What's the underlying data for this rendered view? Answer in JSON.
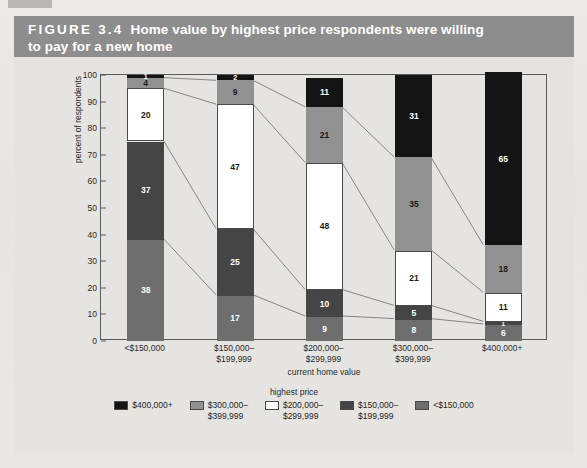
{
  "figure": {
    "number": "FIGURE 3.4",
    "title_line1": "Home value by highest price respondents were willing",
    "title_line2": "to pay for a new home",
    "header_bg": "#8d8d8d"
  },
  "chart_data": {
    "type": "bar",
    "variant": "stacked-100-percent",
    "title": "Home value by highest price respondents were willing to pay for a new home",
    "xlabel": "current home value",
    "ylabel": "percent of respondents",
    "ylim": [
      0,
      100
    ],
    "ytick_labels": [
      "0",
      "10",
      "20",
      "30",
      "40",
      "50",
      "60",
      "70",
      "80",
      "90",
      "100"
    ],
    "ytick_values": [
      0,
      10,
      20,
      30,
      40,
      50,
      60,
      70,
      80,
      90,
      100
    ],
    "grid": false,
    "legend_position": "bottom",
    "legend_title": "highest price",
    "categories": [
      "<$150,000",
      "$150,000–\n$199,999",
      "$200,000–\n$299,999",
      "$300,000–\n$399,999",
      "$400,000+"
    ],
    "category_labels": [
      [
        "<$150,000",
        ""
      ],
      [
        "$150,000–",
        "$199,999"
      ],
      [
        "$200,000–",
        "$299,999"
      ],
      [
        "$300,000–",
        "$399,999"
      ],
      [
        "$400,000+",
        ""
      ]
    ],
    "series": [
      {
        "name": "<$150,000",
        "color": "#6e6e6e",
        "text_color": "#ffffff",
        "values": [
          38,
          17,
          9,
          8,
          6
        ]
      },
      {
        "name": "$150,000–$199,999",
        "color": "#454545",
        "text_color": "#ffffff",
        "values": [
          37,
          25,
          10,
          5,
          1
        ]
      },
      {
        "name": "$200,000–$299,999",
        "color": "#ffffff",
        "text_color": "#1a1a1a",
        "values": [
          20,
          47,
          48,
          21,
          11
        ]
      },
      {
        "name": "$300,000–$399,999",
        "color": "#919191",
        "text_color": "#1a1a1a",
        "values": [
          4,
          9,
          21,
          35,
          18
        ]
      },
      {
        "name": "$400,000+",
        "color": "#141414",
        "text_color": "#ffffff",
        "values": [
          1,
          2,
          11,
          31,
          65
        ]
      }
    ],
    "legend_entries": [
      {
        "label_line1": "$400,000+",
        "label_line2": "",
        "color": "#141414"
      },
      {
        "label_line1": "$300,000–",
        "label_line2": "$399,999",
        "color": "#919191"
      },
      {
        "label_line1": "$200,000–",
        "label_line2": "$299,999",
        "color": "#ffffff"
      },
      {
        "label_line1": "$150,000–",
        "label_line2": "$199,999",
        "color": "#454545"
      },
      {
        "label_line1": "<$150,000",
        "label_line2": "",
        "color": "#6e6e6e"
      }
    ]
  }
}
